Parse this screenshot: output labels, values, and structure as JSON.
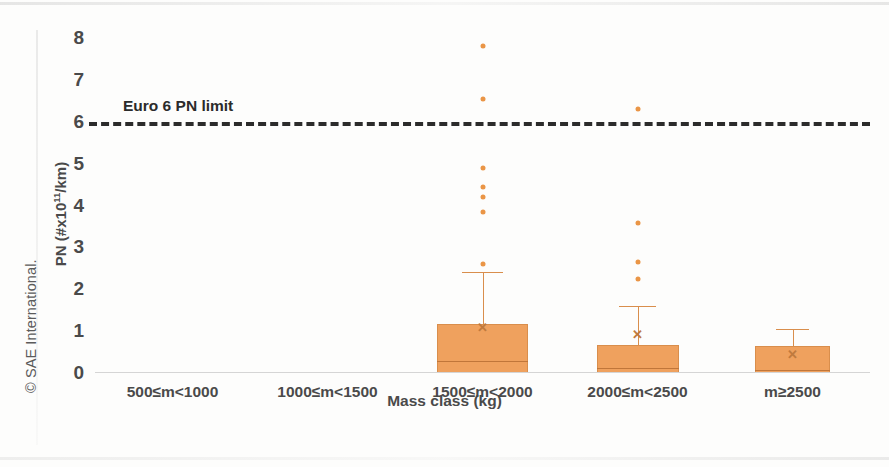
{
  "figure": {
    "copyright": "© SAE International.",
    "y_axis_title_prefix": "PN (#x10",
    "y_axis_title_exponent": "11",
    "y_axis_title_suffix": "/km)",
    "x_axis_title": "Mass class (kg)",
    "limit_label": "Euro 6 PN limit",
    "accent_color": "#EFA15E",
    "accent_edge_color": "#D98E4C",
    "limit_line_color": "#2B2B2B",
    "text_color": "#4A4A4A"
  },
  "chart_data": {
    "type": "box",
    "title": "",
    "xlabel": "Mass class (kg)",
    "ylabel": "PN (#x10^11/km)",
    "ylim": [
      0,
      8
    ],
    "yticks": [
      "0",
      "1",
      "2",
      "3",
      "4",
      "5",
      "6",
      "7",
      "8"
    ],
    "ytick_values": [
      0,
      1,
      2,
      3,
      4,
      5,
      6,
      7,
      8
    ],
    "grid": false,
    "legend": "none",
    "categories": [
      "500≤m<1000",
      "1000≤m<1500",
      "1500≤m<2000",
      "2000≤m<2500",
      "m≥2500"
    ],
    "annotations": [
      {
        "text": "Euro 6 PN limit",
        "y": 6,
        "style": "dashed-horizontal-line"
      }
    ],
    "boxes": [
      {
        "category": "500≤m<1000",
        "has_data": false,
        "q1": null,
        "median": null,
        "q3": null,
        "mean": null,
        "whisker_low": null,
        "whisker_high": null,
        "outliers": []
      },
      {
        "category": "1000≤m<1500",
        "has_data": false,
        "q1": null,
        "median": null,
        "q3": null,
        "mean": null,
        "whisker_low": null,
        "whisker_high": null,
        "outliers": []
      },
      {
        "category": "1500≤m<2000",
        "has_data": true,
        "q1": 0.0,
        "median": 0.28,
        "q3": 1.18,
        "mean": 1.1,
        "whisker_low": 0.0,
        "whisker_high": 2.42,
        "outliers": [
          7.8,
          6.55,
          4.9,
          4.45,
          4.2,
          3.85,
          2.6
        ]
      },
      {
        "category": "2000≤m<2500",
        "has_data": true,
        "q1": 0.0,
        "median": 0.11,
        "q3": 0.67,
        "mean": 0.92,
        "whisker_low": 0.0,
        "whisker_high": 1.6,
        "outliers": [
          6.3,
          3.58,
          2.65,
          2.25
        ]
      },
      {
        "category": "m≥2500",
        "has_data": true,
        "q1": 0.0,
        "median": 0.06,
        "q3": 0.65,
        "mean": 0.45,
        "whisker_low": 0.0,
        "whisker_high": 1.05,
        "outliers": []
      }
    ]
  }
}
